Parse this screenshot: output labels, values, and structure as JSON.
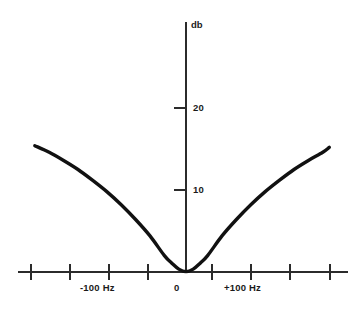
{
  "chart_data": {
    "type": "line",
    "title": "",
    "subtitle": "",
    "xlabel": "",
    "ylabel": "",
    "y_axis_title": "db",
    "grid": false,
    "legend": null,
    "xlim": [
      -215,
      200
    ],
    "ylim": [
      0,
      30
    ],
    "y_ticks": [
      10,
      20
    ],
    "y_tick_labels": [
      "10",
      "20"
    ],
    "x_tick_values": [
      -200,
      -150,
      -100,
      -50,
      50,
      100,
      150,
      200
    ],
    "x_labeled_ticks": [
      {
        "value": -100,
        "label": "-100  Hz"
      },
      {
        "value": 0,
        "label": "0"
      },
      {
        "value": 100,
        "label": "+100  Hz"
      }
    ],
    "series": [
      {
        "name": "response",
        "x": [
          -210,
          -190,
          -170,
          -150,
          -130,
          -110,
          -90,
          -70,
          -50,
          -30,
          -20,
          -10,
          0,
          10,
          20,
          30,
          50,
          70,
          90,
          110,
          130,
          150,
          170,
          190,
          199
        ],
        "values": [
          15.4,
          14.6,
          13.6,
          12.5,
          11.2,
          9.8,
          8.2,
          6.4,
          4.4,
          2.0,
          1.1,
          0.35,
          0.05,
          0.35,
          1.1,
          2.0,
          4.4,
          6.4,
          8.2,
          9.8,
          11.2,
          12.5,
          13.6,
          14.6,
          15.2
        ]
      }
    ],
    "annotations": []
  },
  "axis": {
    "y_title": "db",
    "y_tick_20": "20",
    "y_tick_10": "10",
    "x_label_negative": "-100  Hz",
    "x_label_zero": "0",
    "x_label_positive": "+100  Hz"
  },
  "colors": {
    "curve": "#111111",
    "axis": "#2b2b2b",
    "background": "#ffffff",
    "text": "#1a1a1a"
  }
}
